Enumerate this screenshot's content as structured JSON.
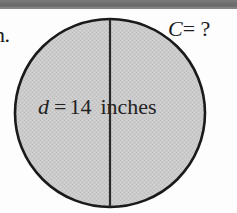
{
  "page": {
    "background_color": "#fdfdfd",
    "scan_band_color": "#6f6f6f"
  },
  "item_marker": {
    "label": "n."
  },
  "figure": {
    "shape": "circle",
    "fill_color": "#c9c9c9",
    "stroke_color": "#1a1a1a",
    "center_x": 110,
    "center_y": 113,
    "radius_x": 96,
    "radius_y": 95,
    "diameter_line": {
      "x": 110,
      "y_top": 18,
      "y_bottom": 208,
      "color": "#2a2a2a"
    }
  },
  "labels": {
    "circumference": {
      "variable": "C",
      "equals": "=",
      "value": "?",
      "full_text": "C= ?"
    },
    "diameter": {
      "variable": "d",
      "equals": "=",
      "number": "14",
      "unit": "inches",
      "full_text": "d = 14 inches"
    }
  }
}
